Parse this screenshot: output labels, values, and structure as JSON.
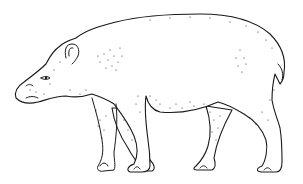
{
  "image": {
    "subject": "tapir",
    "style": "stippled pen-and-ink line drawing",
    "background": "#ffffff",
    "ink": "#1a1a1a",
    "facing": "left"
  }
}
